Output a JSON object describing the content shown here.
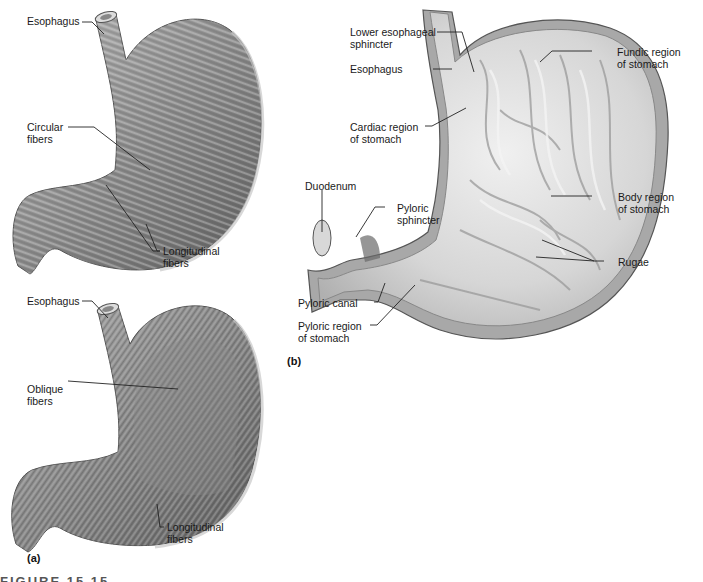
{
  "figure": {
    "caption_partial": "FIGURE 15.15",
    "panels": [
      {
        "id": "a",
        "label": "(a)",
        "description": "Muscular layers of the stomach wall",
        "top_drawing": {
          "labels": {
            "esophagus": "Esophagus",
            "circular_fibers": "Circular\nfibers",
            "longitudinal_fibers": "Longitudinal\nfibers"
          }
        },
        "bottom_drawing": {
          "labels": {
            "esophagus": "Esophagus",
            "oblique_fibers": "Oblique\nfibers",
            "longitudinal_fibers": "Longitudinal\nfibers"
          }
        }
      },
      {
        "id": "b",
        "label": "(b)",
        "description": "Internal regions of the stomach",
        "labels": {
          "lower_esophageal_sphincter": "Lower esophageal\nsphincter",
          "esophagus": "Esophagus",
          "cardiac_region": "Cardiac region\nof stomach",
          "fundic_region": "Fundic region\nof stomach",
          "duodenum": "Duodenum",
          "pyloric_sphincter": "Pyloric\nsphincter",
          "body_region": "Body region\nof stomach",
          "rugae": "Rugae",
          "pyloric_canal": "Pyloric canal",
          "pyloric_region": "Pyloric region\nof stomach"
        }
      }
    ]
  },
  "colors": {
    "muscle_dark": "#6e6e6e",
    "muscle_mid": "#9a9a9a",
    "muscle_light": "#d0d0d0",
    "mucosa_light": "#e6e6e6",
    "mucosa_mid": "#c4c4c4",
    "leader_line": "#222222"
  }
}
